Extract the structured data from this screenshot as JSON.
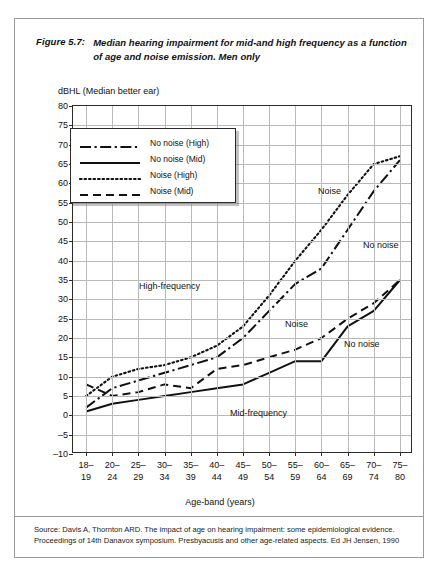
{
  "figure": {
    "number": "Figure 5.7:",
    "caption": "Median hearing impairment for mid-and high frequency as a function of age and noise emission. Men only"
  },
  "source": {
    "line1": "Source: Davis A, Thornton ARD. The impact of age on hearing impairment: some epidemiological evidence.",
    "line2": "Proceedings of 14th Danavox symposium. Presbyacusis and other age-related aspects. Ed JH Jensen, 1990"
  },
  "annotations": [
    {
      "text": "Noise",
      "left": 318,
      "top": 186
    },
    {
      "text": "No noise",
      "left": 363,
      "top": 240
    },
    {
      "text": "High-frequency",
      "left": 139,
      "top": 281
    },
    {
      "text": "Noise",
      "left": 285,
      "top": 319
    },
    {
      "text": "No noise",
      "left": 344,
      "top": 339
    },
    {
      "text": "Mid-frequency",
      "left": 230,
      "top": 408
    }
  ],
  "chart_data": {
    "type": "line",
    "title": "Median hearing impairment for mid-and high frequency as a function of age and noise emission. Men only",
    "xlabel": "Age-band (years)",
    "ylabel": "dBHL (Median better ear)",
    "ylim": [
      -10,
      80
    ],
    "ytick_step": 5,
    "grid": true,
    "legend_position": "upper-left-inside",
    "categories": [
      "18-19",
      "20-24",
      "25-29",
      "30-34",
      "35-39",
      "40-44",
      "45-49",
      "50-54",
      "55-59",
      "60-64",
      "65-69",
      "70-74",
      "75-80"
    ],
    "ytick_labels": [
      "80",
      "75",
      "70",
      "65",
      "60",
      "55",
      "50",
      "45",
      "40",
      "35",
      "30",
      "25",
      "20",
      "15",
      "10",
      "5",
      "0",
      "-5",
      "-10"
    ],
    "series": [
      {
        "name": "No noise (High)",
        "style": "dash-dot",
        "values": [
          2,
          7,
          9,
          11,
          13,
          15,
          20,
          27,
          34,
          38,
          48,
          58,
          66
        ]
      },
      {
        "name": "No noise (Mid)",
        "style": "solid",
        "values": [
          1,
          3,
          4,
          5,
          6,
          7,
          8,
          11,
          14,
          14,
          23,
          27,
          35
        ]
      },
      {
        "name": "Noise (High)",
        "style": "dotted",
        "values": [
          5,
          10,
          12,
          13,
          15,
          18,
          23,
          31,
          40,
          48,
          57,
          65,
          67
        ]
      },
      {
        "name": "Noise (Mid)",
        "style": "dashed",
        "values": [
          8,
          5,
          6,
          8,
          7,
          12,
          13,
          15,
          17,
          20,
          25,
          29,
          35
        ]
      }
    ]
  }
}
